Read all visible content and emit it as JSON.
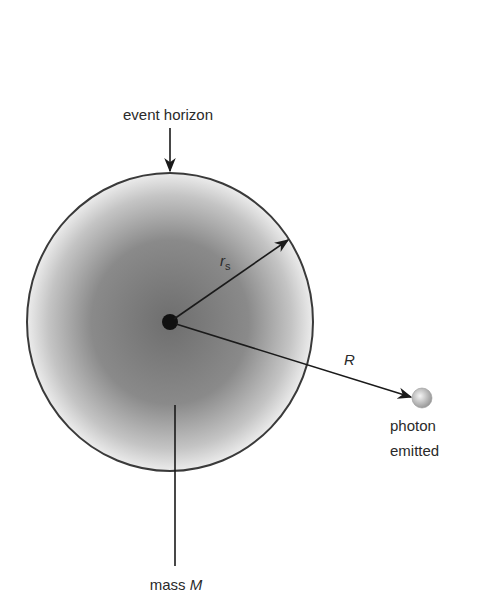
{
  "diagram": {
    "labels": {
      "event_horizon": "event horizon",
      "rs_main": "r",
      "rs_sub": "s",
      "R": "R",
      "photon_line1": "photon",
      "photon_line2": "emitted",
      "mass_prefix": "mass ",
      "mass_symbol": "M"
    },
    "colors": {
      "outline": "#3a3a3a",
      "fill_center": "#7a7a7a",
      "fill_edge": "#e6e6e6",
      "photon": "#bdbdbd",
      "text": "#2a2a2a"
    }
  }
}
